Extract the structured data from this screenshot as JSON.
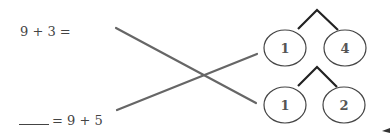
{
  "worksheet": {
    "equations": [
      {
        "id": "top",
        "text": "9 + 3 ="
      },
      {
        "id": "bottom",
        "blank": "____",
        "text": "= 9 + 5"
      }
    ],
    "number_bonds": [
      {
        "id": "bond-top",
        "parts": [
          "1",
          "4"
        ]
      },
      {
        "id": "bond-bottom",
        "parts": [
          "1",
          "2"
        ]
      }
    ],
    "matching_lines": [
      {
        "from": "equation-top",
        "to": "bond-bottom"
      },
      {
        "from": "equation-bottom",
        "to": "bond-top"
      }
    ],
    "colors": {
      "text": "#444444",
      "line": "#666666",
      "bond": "#222222",
      "circle": "#444444"
    }
  }
}
